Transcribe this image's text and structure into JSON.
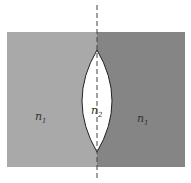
{
  "diagram": {
    "left_region": {
      "label": "n",
      "subscript": "1",
      "color": "#a9a9a9"
    },
    "right_region": {
      "label": "n",
      "subscript": "1",
      "color": "#858585"
    },
    "lens": {
      "label": "n",
      "subscript": "2",
      "color": "#ffffff"
    },
    "axis": {
      "style": "dashed",
      "color": "#444444"
    }
  }
}
